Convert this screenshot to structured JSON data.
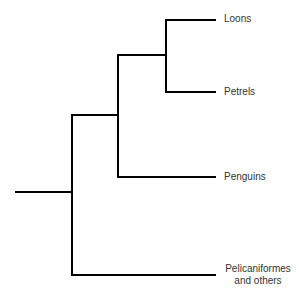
{
  "diagram": {
    "type": "phylogenetic-tree",
    "taxa": [
      {
        "name": "Loons",
        "label": "Loons"
      },
      {
        "name": "Petrels",
        "label": "Petrels"
      },
      {
        "name": "Penguins",
        "label": "Penguins"
      },
      {
        "name": "Pelicaniformes",
        "label_line1": "Pelicaniformes",
        "label_line2": "and others"
      }
    ],
    "topology": "(((Loons, Petrels), Penguins), Pelicaniformes and others)",
    "line_color": "#000000",
    "text_color": "#333333"
  }
}
